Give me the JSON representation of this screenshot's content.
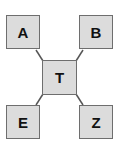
{
  "diagram": {
    "center": {
      "label": "T"
    },
    "nodes": [
      {
        "id": "a",
        "label": "A"
      },
      {
        "id": "b",
        "label": "B"
      },
      {
        "id": "e",
        "label": "E"
      },
      {
        "id": "z",
        "label": "Z"
      }
    ],
    "edges": [
      [
        "T",
        "A"
      ],
      [
        "T",
        "B"
      ],
      [
        "T",
        "E"
      ],
      [
        "T",
        "Z"
      ]
    ],
    "colors": {
      "fill": "#dcdcdc",
      "border": "#6e6e6e",
      "line": "#555555"
    }
  }
}
